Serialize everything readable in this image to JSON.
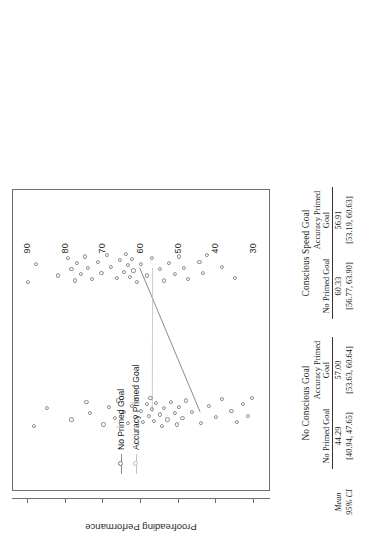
{
  "figure": {
    "y_axis_title": "Proofreading Performance",
    "y_ticks": [
      "90",
      "80",
      "70",
      "60",
      "50",
      "40",
      "30"
    ],
    "y_tick_values": [
      90,
      80,
      70,
      60,
      50,
      40,
      30
    ],
    "legend": {
      "items": [
        {
          "label": "No Primed Goal",
          "marker": "open-circle",
          "color": "#7a7a7a"
        },
        {
          "label": "Accuracy Primed Goal",
          "marker": "open-triangle",
          "color": "#b9b9b9"
        }
      ]
    },
    "x_groups": [
      "No Conscious Goal",
      "Conscious Speed Goal"
    ]
  },
  "table": {
    "groups": [
      {
        "name": "No Conscious Goal",
        "columns": [
          "No Primed Goal",
          "Accuracy Primed Goal"
        ]
      },
      {
        "name": "Conscious Speed Goal",
        "columns": [
          "No Primed Goal",
          "Accuracy Primed Goal"
        ]
      }
    ],
    "row_labels": [
      "Mean",
      "95% CI"
    ],
    "cells": {
      "mean": [
        "44.29",
        "57.00",
        "60.33",
        "56.91"
      ],
      "ci": [
        "[40.94, 47.65]",
        "[53.63, 60.64]",
        "[56.77, 63.90]",
        "[53.19, 60.63]"
      ]
    }
  },
  "chart_data": {
    "type": "line",
    "title": "",
    "xlabel": "",
    "ylabel": "Proofreading Performance",
    "ylim": [
      26,
      94
    ],
    "yticks": [
      90,
      80,
      70,
      60,
      50,
      40,
      30
    ],
    "grid": false,
    "legend_position": "center-left",
    "categories": [
      "No Conscious Goal",
      "Conscious Speed Goal"
    ],
    "series": [
      {
        "name": "No Primed Goal",
        "values": [
          44.29,
          60.33
        ],
        "ci": [
          [
            40.94,
            47.65
          ],
          [
            56.77,
            63.9
          ]
        ],
        "color": "#6f6f6f"
      },
      {
        "name": "Accuracy Primed Goal",
        "values": [
          57.0,
          56.91
        ],
        "ci": [
          [
            53.63,
            60.64
          ],
          [
            53.19,
            60.63
          ]
        ],
        "color": "#b4b4b4"
      }
    ],
    "scatter": {
      "No Conscious Goal": [
        88.5,
        85.0,
        78.5,
        74.5,
        73.6,
        70.0,
        68.5,
        67.0,
        66.0,
        64.5,
        63.5,
        62.5,
        61.5,
        61.0,
        60.0,
        59.5,
        58.5,
        58.0,
        57.5,
        57.0,
        56.5,
        56.0,
        55.0,
        54.5,
        54.0,
        53.0,
        52.0,
        51.0,
        50.5,
        50.0,
        49.0,
        48.0,
        46.5,
        44.0,
        42.0,
        40.0,
        38.5,
        36.0,
        34.5,
        33.0,
        31.5,
        30.5
      ],
      "Conscious Speed Goal": [
        90.0,
        88.0,
        82.0,
        79.5,
        78.5,
        77.5,
        77.0,
        76.0,
        75.0,
        74.0,
        73.0,
        71.5,
        70.5,
        69.0,
        68.0,
        66.5,
        65.5,
        64.5,
        64.0,
        63.5,
        63.0,
        62.5,
        62.0,
        61.0,
        60.0,
        58.5,
        57.0,
        55.0,
        54.0,
        52.5,
        51.0,
        50.0,
        48.5,
        47.5,
        44.5,
        43.5,
        42.5,
        38.5,
        35.0
      ]
    }
  }
}
